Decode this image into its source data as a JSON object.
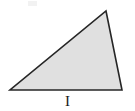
{
  "figure": {
    "label": "I",
    "shape_name": "triangle",
    "background_color": "#ffffff",
    "fill_color": "#e0e0e0",
    "stroke_color": "#262626",
    "stroke_width": 1.6,
    "canvas": {
      "width": 135,
      "height": 111
    },
    "vertices": [
      {
        "name": "apex",
        "x": 106,
        "y": 11
      },
      {
        "name": "bottom-right",
        "x": 122,
        "y": 90
      },
      {
        "name": "bottom-left",
        "x": 10,
        "y": 90
      }
    ],
    "points_attr": "106,11 122,90 10,90",
    "label_position": {
      "x": 66,
      "y": 101
    }
  }
}
